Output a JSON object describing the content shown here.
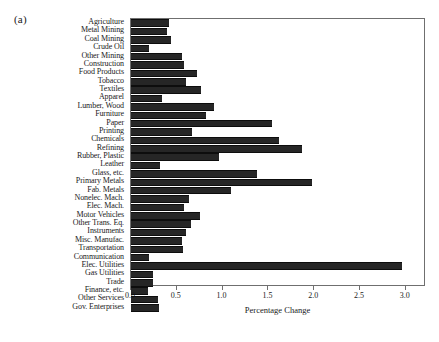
{
  "figure": {
    "panel_letter": "(a)",
    "xlabel": "Percentage Change",
    "colors": {
      "bar": "#262626",
      "axis": "#6f6f6f",
      "background": "#ffffff",
      "text": "#1a1a1a"
    }
  },
  "chart_data": {
    "type": "bar",
    "orientation": "horizontal",
    "title": "",
    "subtitle": "",
    "xlabel": "Percentage Change",
    "ylabel": "",
    "xlim": [
      0.0,
      3.22
    ],
    "xticks": [
      0.0,
      0.5,
      1.0,
      1.5,
      2.0,
      2.5,
      3.0
    ],
    "xticklabels": [
      "0.0",
      "0.5",
      "1.0",
      "1.5",
      "2.0",
      "2.5",
      "3.0"
    ],
    "grid": false,
    "legend": null,
    "annotations": [
      "(a)"
    ],
    "categories": [
      "Agriculture",
      "Metal Mining",
      "Coal Mining",
      "Crude Oil",
      "Other Mining",
      "Construction",
      "Food Products",
      "Tobacco",
      "Textiles",
      "Apparel",
      "Lumber, Wood",
      "Furniture",
      "Paper",
      "Printing",
      "Chemicals",
      "Refining",
      "Rubber, Plastic",
      "Leather",
      "Glass, etc.",
      "Primary Metals",
      "Fab. Metals",
      "Nonelec. Mach.",
      "Elec. Mach.",
      "Motor Vehicles",
      "Other Trans. Eq.",
      "Instruments",
      "Misc. Manufac.",
      "Transportation",
      "Communication",
      "Elec. Utilities",
      "Gas Utilities",
      "Trade",
      "Finance, etc.",
      "Other Services",
      "Gov. Enterprises"
    ],
    "values": [
      0.41,
      0.39,
      0.44,
      0.2,
      0.56,
      0.58,
      0.72,
      0.6,
      0.76,
      0.34,
      0.91,
      0.82,
      1.54,
      0.67,
      1.62,
      1.87,
      0.96,
      0.32,
      1.38,
      1.98,
      1.09,
      0.63,
      0.58,
      0.75,
      0.66,
      0.6,
      0.56,
      0.57,
      0.2,
      2.96,
      0.24,
      0.24,
      0.19,
      0.3,
      0.31
    ]
  }
}
